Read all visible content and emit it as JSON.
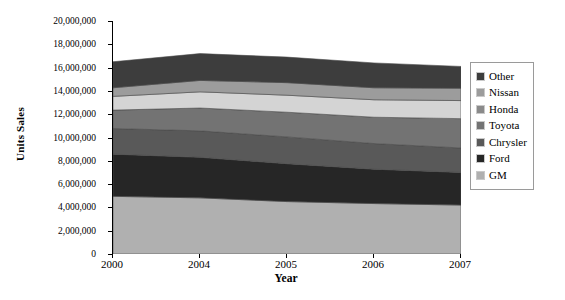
{
  "chart_data": {
    "type": "area",
    "stacked": true,
    "title": "",
    "xlabel": "Year",
    "ylabel": "Units Sales",
    "categories": [
      "2000",
      "2004",
      "2005",
      "2006",
      "2007"
    ],
    "x_tick_labels": [
      "2000",
      "2004",
      "2005",
      "2006",
      "2007"
    ],
    "y_tick_labels": [
      "0",
      "2,000,000",
      "4,000,000",
      "6,000,000",
      "8,000,000",
      "10,000,000",
      "12,000,000",
      "14,000,000",
      "16,000,000",
      "18,000,000",
      "20,000,000"
    ],
    "y_tick_values": [
      0,
      2000000,
      4000000,
      6000000,
      8000000,
      10000000,
      12000000,
      14000000,
      16000000,
      18000000,
      20000000
    ],
    "ylim": [
      0,
      20000000
    ],
    "y_tick_step": 2000000,
    "grid": false,
    "legend_position": "right",
    "stack_order_bottom_to_top": [
      "GM",
      "Ford",
      "Chrysler",
      "Toyota",
      "Honda",
      "Nissan",
      "Other"
    ],
    "series": [
      {
        "name": "GM",
        "color": "#b0b0b0",
        "values": [
          4950000,
          4820000,
          4500000,
          4330000,
          4200000
        ]
      },
      {
        "name": "Ford",
        "color": "#262626",
        "values": [
          3620000,
          3480000,
          3250000,
          2950000,
          2800000
        ]
      },
      {
        "name": "Chrysler",
        "color": "#595959",
        "values": [
          2200000,
          2270000,
          2300000,
          2200000,
          2100000
        ]
      },
      {
        "name": "Toyota",
        "color": "#737373",
        "values": [
          1580000,
          1960000,
          2120000,
          2260000,
          2520000
        ]
      },
      {
        "name": "Honda",
        "color": "#d4d4d4",
        "values": [
          1180000,
          1390000,
          1460000,
          1500000,
          1550000
        ]
      },
      {
        "name": "Nissan",
        "color": "#9c9c9c",
        "values": [
          740000,
          980000,
          1080000,
          1030000,
          1060000
        ]
      },
      {
        "name": "Other",
        "color": "#3d3d3d",
        "values": [
          2230000,
          2300000,
          2190000,
          2130000,
          1870000
        ]
      }
    ],
    "totals": [
      16500000,
      17200000,
      16900000,
      16400000,
      16100000
    ],
    "legend_entries": [
      {
        "label": "Other",
        "color": "#3d3d3d"
      },
      {
        "label": "Nissan",
        "color": "#9c9c9c"
      },
      {
        "label": "Honda",
        "color": "#8a8a8a"
      },
      {
        "label": "Toyota",
        "color": "#737373"
      },
      {
        "label": "Chrysler",
        "color": "#595959"
      },
      {
        "label": "Ford",
        "color": "#262626"
      },
      {
        "label": "GM",
        "color": "#b0b0b0"
      }
    ]
  }
}
